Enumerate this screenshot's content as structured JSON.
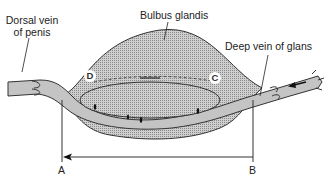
{
  "diagram": {
    "labels": {
      "dorsal_vein_line1": "Dorsal vein",
      "dorsal_vein_line2": "of penis",
      "bulbus_glandis": "Bulbus glandis",
      "deep_vein": "Deep vein of glans",
      "point_a": "A",
      "point_b": "B",
      "point_c": "C",
      "point_d": "D"
    },
    "colors": {
      "stipple_fill": "#b8b8b8",
      "vein_fill": "#c4c4c4",
      "outline": "#333333",
      "background": "#ffffff"
    },
    "arrow": {
      "from": "B",
      "to": "A",
      "direction": "left"
    }
  }
}
